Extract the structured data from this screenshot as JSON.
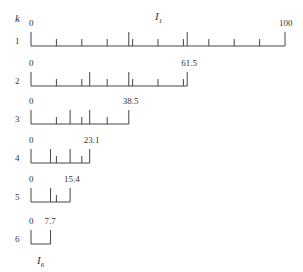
{
  "diagram": {
    "k_label": "k",
    "top_interval_label": "I",
    "top_interval_sub": "1",
    "bottom_interval_label": "I",
    "bottom_interval_sub": "6",
    "scale": {
      "x0": 31,
      "px_per_unit": 2.54
    },
    "rows": [
      {
        "k": "1",
        "start_label": "0",
        "end_label": "100",
        "end": 100,
        "baseline_y": 46,
        "ticks": [
          {
            "v": 10,
            "tall": false
          },
          {
            "v": 20,
            "tall": false
          },
          {
            "v": 30,
            "tall": false
          },
          {
            "v": 38.5,
            "tall": true
          },
          {
            "v": 40,
            "tall": false
          },
          {
            "v": 50,
            "tall": false
          },
          {
            "v": 60,
            "tall": false
          },
          {
            "v": 61.5,
            "tall": true
          },
          {
            "v": 70,
            "tall": false
          },
          {
            "v": 80,
            "tall": false
          },
          {
            "v": 90,
            "tall": false
          }
        ]
      },
      {
        "k": "2",
        "start_label": "0",
        "end_label": "61.5",
        "end": 61.5,
        "baseline_y": 86,
        "ticks": [
          {
            "v": 10,
            "tall": false
          },
          {
            "v": 20,
            "tall": false
          },
          {
            "v": 23.1,
            "tall": true
          },
          {
            "v": 30,
            "tall": false
          },
          {
            "v": 38.5,
            "tall": true
          },
          {
            "v": 40,
            "tall": false
          },
          {
            "v": 50,
            "tall": false
          },
          {
            "v": 60,
            "tall": false
          }
        ]
      },
      {
        "k": "3",
        "start_label": "0",
        "end_label": "38.5",
        "end": 38.5,
        "baseline_y": 124,
        "ticks": [
          {
            "v": 10,
            "tall": false
          },
          {
            "v": 15.4,
            "tall": true
          },
          {
            "v": 20,
            "tall": false
          },
          {
            "v": 23.1,
            "tall": true
          },
          {
            "v": 30,
            "tall": false
          }
        ]
      },
      {
        "k": "4",
        "start_label": "0",
        "end_label": "23.1",
        "end": 23.1,
        "baseline_y": 163,
        "ticks": [
          {
            "v": 7.7,
            "tall": true
          },
          {
            "v": 10,
            "tall": false
          },
          {
            "v": 15.4,
            "tall": true
          },
          {
            "v": 20,
            "tall": false
          }
        ]
      },
      {
        "k": "5",
        "start_label": "0",
        "end_label": "15.4",
        "end": 15.4,
        "baseline_y": 202,
        "ticks": [
          {
            "v": 7.7,
            "tall": true
          },
          {
            "v": 10,
            "tall": false
          }
        ]
      },
      {
        "k": "6",
        "start_label": "0",
        "end_label": "7.7",
        "end": 7.7,
        "baseline_y": 244,
        "ticks": []
      }
    ]
  }
}
